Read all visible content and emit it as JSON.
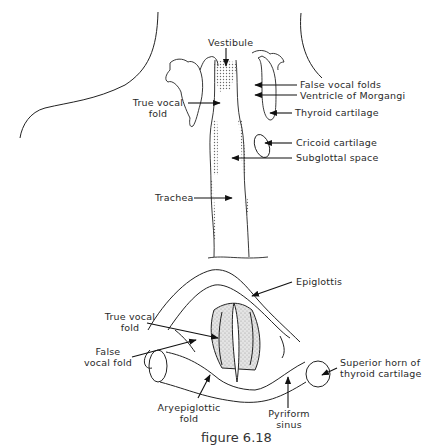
{
  "figure": {
    "caption": "figure 6.18",
    "top_view": {
      "title": "Coronal section of larynx",
      "labels": {
        "vestibule": "Vestibule",
        "false_vocal_folds": "False vocal folds",
        "ventricle": "Ventricle of Morgangi",
        "thyroid_cartilage": "Thyroid cartilage",
        "true_vocal_fold_l1": "True vocal",
        "true_vocal_fold_l2": "fold",
        "cricoid_cartilage": "Cricoid cartilage",
        "subglottal_space": "Subglottal space",
        "trachea": "Trachea"
      }
    },
    "bottom_view": {
      "title": "Superior view of larynx",
      "labels": {
        "epiglottis": "Epiglottis",
        "true_vocal_fold_l1": "True vocal",
        "true_vocal_fold_l2": "fold",
        "false_vocal_fold_l1": "False",
        "false_vocal_fold_l2": "vocal fold",
        "superior_horn_l1": "Superior horn of",
        "superior_horn_l2": "thyroid cartilage",
        "aryepiglottic_l1": "Aryepiglottic",
        "aryepiglottic_l2": "fold",
        "pyriform_l1": "Pyriform",
        "pyriform_l2": "sinus"
      }
    }
  }
}
